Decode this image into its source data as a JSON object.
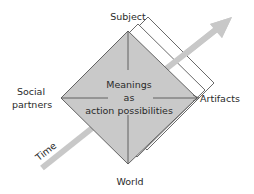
{
  "diagram": {
    "center_text": {
      "line1": "Meanings",
      "line2": "as",
      "line3": "action possibilities"
    },
    "vertices": {
      "top": "Subject",
      "left_line1": "Social",
      "left_line2": "partners",
      "right": "Artifacts",
      "bottom": "World"
    },
    "axis": {
      "label": "Time"
    },
    "layers_behind": 2,
    "colors": {
      "diamond_fill": "#c9c9c9",
      "diamond_stroke": "#555555",
      "arrow": "#c8c8c8",
      "layer_fill": "#ffffff",
      "layer_stroke": "#444444",
      "text": "#2a2a2a"
    }
  }
}
